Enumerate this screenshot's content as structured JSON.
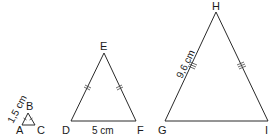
{
  "diagram": {
    "type": "similar-isosceles-triangles",
    "triangles": [
      {
        "name": "ABC",
        "vertices": {
          "A": "A",
          "B": "B",
          "C": "C"
        },
        "labeled_side": {
          "side": "AB",
          "label": "1,5 cm"
        },
        "equal_sides_marked": [
          "AB",
          "BC"
        ]
      },
      {
        "name": "DEF",
        "vertices": {
          "D": "D",
          "E": "E",
          "F": "F"
        },
        "labeled_side": {
          "side": "DF",
          "label": "5 cm"
        },
        "equal_sides_marked": [
          "DE",
          "EF"
        ]
      },
      {
        "name": "GHI",
        "vertices": {
          "G": "G",
          "H": "H",
          "I": "I"
        },
        "labeled_side": {
          "side": "GH",
          "label": "9,6 cm"
        },
        "equal_sides_marked": [
          "GH",
          "HI"
        ]
      }
    ]
  },
  "colors": {
    "stroke": "#2a2a2a",
    "text": "#1a1a1a",
    "background": "#ffffff"
  }
}
